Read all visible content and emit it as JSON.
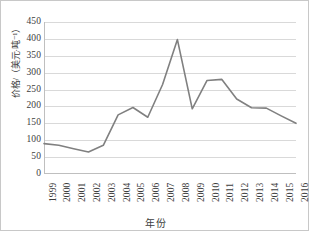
{
  "chart_data": {
    "type": "line",
    "title": "",
    "xlabel": "年份",
    "ylabel": "价格/（美元·吨⁻¹）",
    "categories": [
      "1999",
      "2000",
      "2001",
      "2002",
      "2003",
      "2004",
      "2005",
      "2006",
      "2007",
      "2008",
      "2009",
      "2010",
      "2011",
      "2012",
      "2013",
      "2014",
      "2015",
      "2016"
    ],
    "series": [
      {
        "name": "价格",
        "color": "#808080",
        "values": [
          90,
          85,
          75,
          65,
          85,
          175,
          197,
          168,
          265,
          398,
          193,
          277,
          280,
          222,
          196,
          195,
          172,
          150
        ]
      }
    ],
    "ylim": [
      0,
      450
    ],
    "ytick_step": 50,
    "yticks": [
      "450",
      "400",
      "350",
      "300",
      "250",
      "200",
      "150",
      "100",
      "50",
      "0"
    ],
    "grid": "horizontal",
    "legend": "none"
  },
  "figure": {
    "background": "#ffffff",
    "border_color": "#c8c8c8",
    "gridline_color": "#d9d9d9",
    "axis_color": "#bfbfbf",
    "text_color": "#3d3d3d"
  }
}
